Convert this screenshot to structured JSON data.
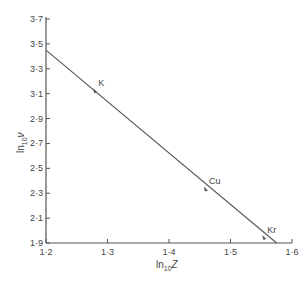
{
  "chart_data": {
    "type": "line",
    "title": "",
    "xlabel": "ln10Z",
    "ylabel": "ln10ν",
    "xlabel_main": "ln",
    "xlabel_sub": "10",
    "xlabel_var": "Z",
    "ylabel_main": "ln",
    "ylabel_sub": "10",
    "ylabel_var": "ν",
    "xlim": [
      1.2,
      1.6
    ],
    "ylim": [
      1.9,
      3.7
    ],
    "x_ticks": [
      "1·2",
      "1·3",
      "1·4",
      "1·5",
      "1·6"
    ],
    "x_tick_values": [
      1.2,
      1.3,
      1.4,
      1.5,
      1.6
    ],
    "y_ticks": [
      "1·9",
      "2·1",
      "2·3",
      "2·5",
      "2·7",
      "2·9",
      "3·1",
      "3·3",
      "3·5",
      "3·7"
    ],
    "y_tick_values": [
      1.9,
      2.1,
      2.3,
      2.5,
      2.7,
      2.9,
      3.1,
      3.3,
      3.5,
      3.7
    ],
    "grid": false,
    "legend": null,
    "series": [
      {
        "name": "fit line",
        "x": [
          1.2,
          1.575
        ],
        "y": [
          3.45,
          1.9
        ]
      }
    ],
    "points": [
      {
        "label": "K",
        "x": 1.28,
        "y": 3.12
      },
      {
        "label": "Cu",
        "x": 1.46,
        "y": 2.33
      },
      {
        "label": "Kr",
        "x": 1.555,
        "y": 1.94
      }
    ]
  }
}
